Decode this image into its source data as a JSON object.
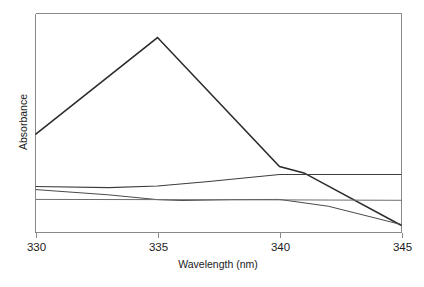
{
  "chart_data": {
    "type": "line",
    "title": "",
    "subtitle": "",
    "xlabel": "Wavelength (nm)",
    "ylabel": "Absorbance",
    "xlim": [
      330,
      345
    ],
    "ylim": [
      0,
      1
    ],
    "xticks": [
      330,
      335,
      340,
      345
    ],
    "xtick_labels": [
      "330",
      "335",
      "340",
      "345"
    ],
    "yticks": [],
    "ytick_labels": [],
    "grid": false,
    "legend": false,
    "legend_position": "none",
    "annotations": [],
    "note": "Four overlaid UV absorbance spectra; y axis unlabeled (arbitrary absorbance units, estimated 0-1 scale from plot frame).",
    "series": [
      {
        "name": "spectrum-1-peak",
        "color": "#2b2b2b",
        "width": 1.5,
        "x": [
          330,
          335,
          340,
          341,
          345
        ],
        "y": [
          0.448,
          0.89,
          0.301,
          0.272,
          0.032
        ]
      },
      {
        "name": "spectrum-2-rising",
        "color": "#3d3d3d",
        "width": 1.1,
        "x": [
          330,
          333,
          335,
          337,
          340,
          342,
          345
        ],
        "y": [
          0.21,
          0.205,
          0.212,
          0.232,
          0.265,
          0.265,
          0.265
        ]
      },
      {
        "name": "spectrum-3-dipping",
        "color": "#4a4a4a",
        "width": 1.0,
        "x": [
          330,
          333,
          335,
          336,
          338,
          340,
          342,
          345
        ],
        "y": [
          0.196,
          0.172,
          0.15,
          0.146,
          0.15,
          0.151,
          0.12,
          0.036
        ]
      },
      {
        "name": "spectrum-4-flat",
        "color": "#6e6e6e",
        "width": 1.0,
        "x": [
          330,
          336,
          340,
          345
        ],
        "y": [
          0.151,
          0.15,
          0.149,
          0.147
        ]
      }
    ]
  },
  "figure": {
    "background": "#ffffff",
    "frame_color": "#8a8a8a",
    "text_color": "#1a1a1a"
  }
}
